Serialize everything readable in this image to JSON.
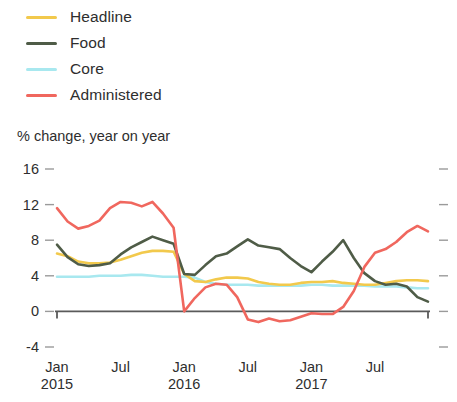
{
  "legend": {
    "items": [
      {
        "label": "Headline",
        "color": "#f2c94c",
        "key": "headline"
      },
      {
        "label": "Food",
        "color": "#4f5c47",
        "key": "food"
      },
      {
        "label": "Core",
        "color": "#a8e8ef",
        "key": "core"
      },
      {
        "label": "Administered",
        "color": "#f0675e",
        "key": "administered"
      }
    ]
  },
  "chart_data": {
    "type": "line",
    "title": "",
    "subtitle": "",
    "ylabel": "% change, year on year",
    "xlabel": "",
    "ylim": [
      -4,
      16
    ],
    "yticks": [
      16,
      12,
      8,
      4,
      0,
      -4
    ],
    "ytick_labels": [
      "16",
      "12",
      "8",
      "4",
      "0",
      "-4"
    ],
    "grid": false,
    "zero_line": true,
    "legend_position": "top-left",
    "x": [
      "Jan 2015",
      "Feb 2015",
      "Mar 2015",
      "Apr 2015",
      "May 2015",
      "Jun 2015",
      "Jul 2015",
      "Aug 2015",
      "Sep 2015",
      "Oct 2015",
      "Nov 2015",
      "Dec 2015",
      "Jan 2016",
      "Feb 2016",
      "Mar 2016",
      "Apr 2016",
      "May 2016",
      "Jun 2016",
      "Jul 2016",
      "Aug 2016",
      "Sep 2016",
      "Oct 2016",
      "Nov 2016",
      "Dec 2016",
      "Jan 2017",
      "Feb 2017",
      "Mar 2017",
      "Apr 2017",
      "May 2017",
      "Jun 2017",
      "Jul 2017",
      "Aug 2017",
      "Sep 2017",
      "Oct 2017",
      "Nov 2017",
      "Dec 2017"
    ],
    "xtick_labels": [
      {
        "month": "Jan",
        "year": "2015",
        "index": 0
      },
      {
        "month": "Jul",
        "year": "",
        "index": 6
      },
      {
        "month": "Jan",
        "year": "2016",
        "index": 12
      },
      {
        "month": "Jul",
        "year": "",
        "index": 18
      },
      {
        "month": "Jan",
        "year": "2017",
        "index": 24
      },
      {
        "month": "Jul",
        "year": "",
        "index": 30
      }
    ],
    "series": [
      {
        "name": "Headline",
        "color": "#f2c94c",
        "values": [
          6.5,
          6.2,
          5.6,
          5.4,
          5.4,
          5.5,
          5.8,
          6.2,
          6.6,
          6.8,
          6.8,
          6.7,
          4.2,
          3.4,
          3.3,
          3.6,
          3.8,
          3.8,
          3.7,
          3.3,
          3.1,
          3.0,
          3.0,
          3.2,
          3.3,
          3.3,
          3.4,
          3.2,
          3.1,
          3.0,
          3.0,
          3.2,
          3.4,
          3.5,
          3.5,
          3.4
        ]
      },
      {
        "name": "Food",
        "color": "#4f5c47",
        "values": [
          7.5,
          6.1,
          5.3,
          5.1,
          5.2,
          5.4,
          6.4,
          7.2,
          7.8,
          8.4,
          8.0,
          7.6,
          4.2,
          4.1,
          5.2,
          6.2,
          6.5,
          7.3,
          8.1,
          7.4,
          7.2,
          7.0,
          6.0,
          5.1,
          4.4,
          5.6,
          6.7,
          8.0,
          6.0,
          4.3,
          3.4,
          3.0,
          3.1,
          2.8,
          1.6,
          1.1
        ]
      },
      {
        "name": "Core",
        "color": "#a8e8ef",
        "values": [
          3.9,
          3.9,
          3.9,
          3.9,
          4.0,
          4.0,
          4.0,
          4.1,
          4.1,
          4.0,
          3.9,
          3.9,
          3.9,
          3.8,
          3.3,
          3.1,
          3.0,
          3.0,
          3.0,
          2.9,
          2.9,
          2.9,
          2.9,
          2.9,
          3.0,
          3.0,
          2.9,
          2.9,
          2.9,
          2.9,
          2.8,
          2.8,
          2.8,
          2.7,
          2.6,
          2.6
        ]
      },
      {
        "name": "Administered",
        "color": "#f0675e",
        "values": [
          11.6,
          10.1,
          9.3,
          9.6,
          10.2,
          11.6,
          12.3,
          12.2,
          11.8,
          12.3,
          11.0,
          9.4,
          0.0,
          1.5,
          2.7,
          3.1,
          3.0,
          1.6,
          -0.9,
          -1.2,
          -0.8,
          -1.1,
          -1.0,
          -0.6,
          -0.2,
          -0.3,
          -0.3,
          0.5,
          2.3,
          5.0,
          6.6,
          7.0,
          7.8,
          8.9,
          9.6,
          9.0
        ]
      }
    ]
  }
}
